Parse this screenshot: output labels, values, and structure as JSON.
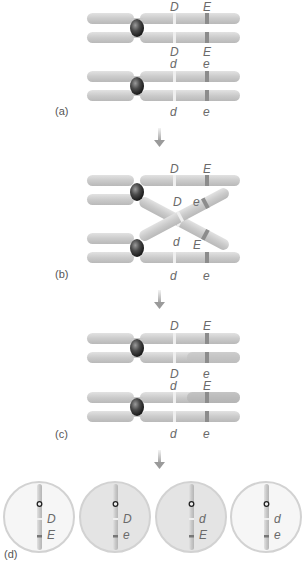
{
  "figure": {
    "colors": {
      "chromatid": "#cfcfcf",
      "chromatid_shade": "#b8b8b8",
      "centromere": "#2a2a2a",
      "band_D": "#eeeeee",
      "band_E": "#8a8a8a",
      "cell_fill_light": "#f6f6f6",
      "cell_fill_dark": "#e4e4e4",
      "cell_border": "#cfcfcf",
      "arrow": "#a8a8a8",
      "text": "#6a6a6a"
    }
  },
  "panels": [
    {
      "id": "a",
      "label": "(a)",
      "top_chromosome": {
        "above": [
          "D",
          "E"
        ],
        "below": [
          "D",
          "E"
        ]
      },
      "bottom_chromosome": {
        "above": [
          "d",
          "e"
        ],
        "below": [
          "d",
          "e"
        ]
      }
    },
    {
      "id": "b",
      "label": "(b)",
      "top_chromosome": {
        "above": [
          "D",
          "E"
        ]
      },
      "crossover": {
        "upper": [
          "D",
          "e"
        ],
        "lower": [
          "d",
          "E"
        ]
      },
      "bottom_chromosome": {
        "below": [
          "d",
          "e"
        ]
      }
    },
    {
      "id": "c",
      "label": "(c)",
      "top_chromosome": {
        "above": [
          "D",
          "E"
        ],
        "below": [
          "D",
          "e"
        ]
      },
      "bottom_chromosome": {
        "above": [
          "d",
          "E"
        ],
        "below": [
          "d",
          "e"
        ]
      }
    },
    {
      "id": "d",
      "label": "(d)",
      "gametes": [
        {
          "genes": [
            "D",
            "E"
          ],
          "type": "parental"
        },
        {
          "genes": [
            "D",
            "e"
          ],
          "type": "recombinant"
        },
        {
          "genes": [
            "d",
            "E"
          ],
          "type": "recombinant"
        },
        {
          "genes": [
            "d",
            "e"
          ],
          "type": "parental"
        }
      ]
    }
  ]
}
